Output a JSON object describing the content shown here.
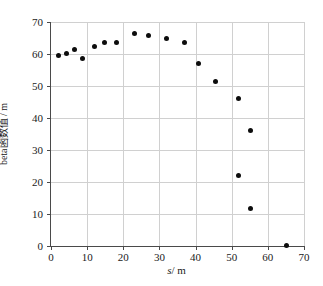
{
  "chart_data": {
    "type": "scatter",
    "title": "",
    "xlabel": "s / m",
    "xlabel_symbol": "s",
    "xlabel_unit": "/ m",
    "ylabel": "beta函数值 / m",
    "xlim": [
      0,
      70
    ],
    "ylim": [
      0,
      70
    ],
    "xticks": [
      0,
      10,
      20,
      30,
      40,
      50,
      60,
      70
    ],
    "yticks": [
      0,
      10,
      20,
      30,
      40,
      50,
      60,
      70
    ],
    "xticklabels": [
      "0",
      "10",
      "20",
      "30",
      "40",
      "50",
      "60",
      "70"
    ],
    "yticklabels": [
      "0",
      "10",
      "20",
      "30",
      "40",
      "50",
      "60",
      "70"
    ],
    "grid": true,
    "legend": false,
    "marker": "filled-circle",
    "marker_color": "#0d0d0d",
    "marker_size": 5,
    "points": [
      {
        "x": 2.0,
        "y": 59.6
      },
      {
        "x": 4.2,
        "y": 60.3
      },
      {
        "x": 6.4,
        "y": 61.3
      },
      {
        "x": 8.8,
        "y": 58.6
      },
      {
        "x": 11.9,
        "y": 62.2
      },
      {
        "x": 14.9,
        "y": 63.6
      },
      {
        "x": 18.0,
        "y": 63.5
      },
      {
        "x": 23.0,
        "y": 66.4
      },
      {
        "x": 26.9,
        "y": 65.7
      },
      {
        "x": 31.9,
        "y": 64.9
      },
      {
        "x": 37.0,
        "y": 63.6
      },
      {
        "x": 40.7,
        "y": 57.1
      },
      {
        "x": 45.4,
        "y": 51.5
      },
      {
        "x": 51.9,
        "y": 46.0
      },
      {
        "x": 55.2,
        "y": 36.0
      },
      {
        "x": 51.9,
        "y": 22.1
      },
      {
        "x": 55.2,
        "y": 11.7
      },
      {
        "x": 65.1,
        "y": 0.3
      }
    ]
  }
}
